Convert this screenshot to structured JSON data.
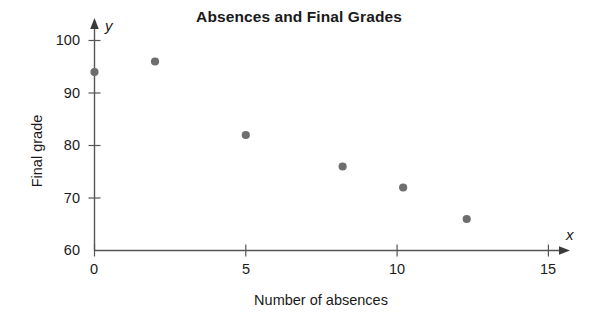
{
  "chart_data": {
    "type": "scatter",
    "title": "Absences and Final Grades",
    "xlabel": "Number of absences",
    "ylabel": "Final grade",
    "x_axis_letter": "x",
    "y_axis_letter": "y",
    "xlim": [
      0,
      15
    ],
    "ylim": [
      60,
      100
    ],
    "xticks": [
      0,
      5,
      10,
      15
    ],
    "yticks": [
      60,
      70,
      80,
      90,
      100
    ],
    "xtick_labels": [
      "0",
      "5",
      "10",
      "15"
    ],
    "ytick_labels": [
      "60",
      "70",
      "80",
      "90",
      "100"
    ],
    "grid": false,
    "legend": "none",
    "marker_color": "#6e6e6e",
    "axis_color": "#555555",
    "points": [
      {
        "x": 0,
        "y": 94
      },
      {
        "x": 2,
        "y": 96
      },
      {
        "x": 5,
        "y": 82
      },
      {
        "x": 8.2,
        "y": 76
      },
      {
        "x": 10.2,
        "y": 72
      },
      {
        "x": 12.3,
        "y": 66
      }
    ],
    "series": [
      {
        "name": "Absences vs Final grade",
        "x": [
          0,
          2,
          5,
          8.2,
          10.2,
          12.3
        ],
        "values": [
          94,
          96,
          82,
          76,
          72,
          66
        ]
      }
    ]
  },
  "ticks": {
    "y": [
      {
        "label": "100"
      },
      {
        "label": "90"
      },
      {
        "label": "80"
      },
      {
        "label": "70"
      },
      {
        "label": "60"
      }
    ],
    "x": [
      {
        "label": "0"
      },
      {
        "label": "5"
      },
      {
        "label": "10"
      },
      {
        "label": "15"
      }
    ]
  }
}
